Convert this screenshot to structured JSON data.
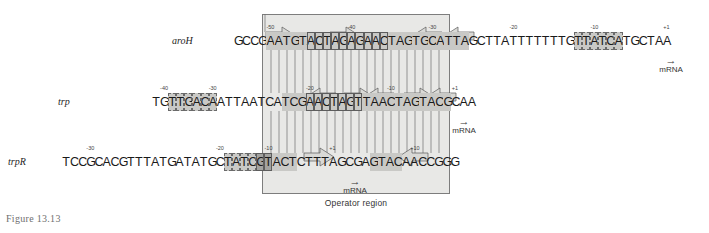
{
  "figure": {
    "caption": "Figure 13.13",
    "operator_region_label": "Operator region"
  },
  "rows": [
    {
      "gene": "aroH",
      "sequence": "GCCGAATGTACTAGAGAACTAGTGCATTAGCTTATTTTTTTGTTATCATGCTAA",
      "ticks": [
        {
          "label": "-50",
          "index": 4
        },
        {
          "label": "-40",
          "index": 14
        },
        {
          "label": "-30",
          "index": 24
        },
        {
          "label": "-20",
          "index": 34
        },
        {
          "label": "-10",
          "index": 44
        },
        {
          "label": "+1",
          "index": 53
        }
      ],
      "highlights": [
        {
          "start": 4,
          "end": 9,
          "style": "hl"
        },
        {
          "start": 9,
          "end": 19,
          "style": "hl boxed"
        },
        {
          "start": 19,
          "end": 29,
          "style": "hl"
        },
        {
          "start": 42,
          "end": 48,
          "style": "hl dashbox"
        }
      ],
      "mrna": {
        "label": "mRNA",
        "arrow": "→"
      }
    },
    {
      "gene": "trp",
      "sequence": "TGTTGACAATTAATCATCGAACTAGTTAACTAGTACGCAA",
      "ticks": [
        {
          "label": "-40",
          "index": 1
        },
        {
          "label": "-30",
          "index": 7
        },
        {
          "label": "-20",
          "index": 19
        },
        {
          "label": "-10",
          "index": 29
        },
        {
          "label": "+1",
          "index": 37
        }
      ],
      "highlights": [
        {
          "start": 2,
          "end": 8,
          "style": "hl dashbox"
        },
        {
          "start": 16,
          "end": 19,
          "style": "hl"
        },
        {
          "start": 19,
          "end": 26,
          "style": "hl boxed"
        },
        {
          "start": 26,
          "end": 34,
          "style": "hl"
        },
        {
          "start": 34,
          "end": 37,
          "style": "hl"
        }
      ],
      "mrna": {
        "label": "mRNA",
        "arrow": "→"
      }
    },
    {
      "gene": "trpR",
      "sequence": "TCCGCACGTTTATGATATGCTATCGTACTCTTTAGCGAGTACAACCGGG",
      "ticks": [
        {
          "label": "-30",
          "index": 3
        },
        {
          "label": "-20",
          "index": 19
        },
        {
          "label": "-10",
          "index": 25
        },
        {
          "label": "+1",
          "index": 33
        },
        {
          "label": "+10",
          "index": 43
        }
      ],
      "highlights": [
        {
          "start": 20,
          "end": 24,
          "style": "hl dashbox"
        },
        {
          "start": 24,
          "end": 26,
          "style": "hl-dark boxed"
        },
        {
          "start": 26,
          "end": 29,
          "style": "hl"
        },
        {
          "start": 38,
          "end": 42,
          "style": "hl"
        }
      ],
      "mrna": {
        "label": "mRNA",
        "arrow": "→"
      }
    }
  ],
  "icons": {
    "mrna_arrow": "right-arrow-icon",
    "repeat_arrow": "inverted-repeat-arrow-icon"
  },
  "colors": {
    "operator_fill": "#e8e8e6",
    "highlight": "#c9c9c6",
    "highlight_dark": "#a3a3a0",
    "line": "#7d7d7d",
    "text": "#1a1a1a",
    "caption": "#6f6f6f"
  }
}
